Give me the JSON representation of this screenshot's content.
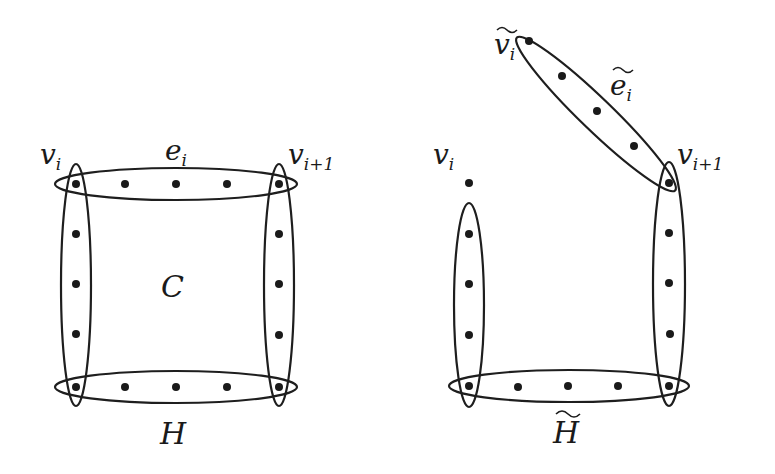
{
  "figure": {
    "left": {
      "name": "H",
      "labels": {
        "cycle": "C",
        "edge": "e",
        "edge_sub": "i",
        "vertex_left": "v",
        "vertex_left_sub": "i",
        "vertex_right": "v",
        "vertex_right_sub": "i+1",
        "hypergraph": "H"
      },
      "edges": [
        {
          "id": "e_i",
          "orientation": "horizontal",
          "vertices": 5
        },
        {
          "id": "bottom",
          "orientation": "horizontal",
          "vertices": 5
        },
        {
          "id": "left",
          "orientation": "vertical",
          "vertices": 6
        },
        {
          "id": "right",
          "orientation": "vertical",
          "vertices": 6
        }
      ]
    },
    "right": {
      "name": "H-tilde",
      "labels": {
        "edge_tilde": "e",
        "edge_tilde_sub": "i",
        "vertex_tilde": "v",
        "vertex_tilde_sub": "i",
        "vertex_left": "v",
        "vertex_left_sub": "i",
        "vertex_right": "v",
        "vertex_right_sub": "i+1",
        "hypergraph": "H"
      },
      "edges": [
        {
          "id": "e_i_tilde",
          "orientation": "diagonal",
          "vertices": 5
        },
        {
          "id": "bottom",
          "orientation": "horizontal",
          "vertices": 5
        },
        {
          "id": "left",
          "orientation": "vertical",
          "vertices": 5
        },
        {
          "id": "right",
          "orientation": "vertical",
          "vertices": 6
        }
      ]
    }
  }
}
